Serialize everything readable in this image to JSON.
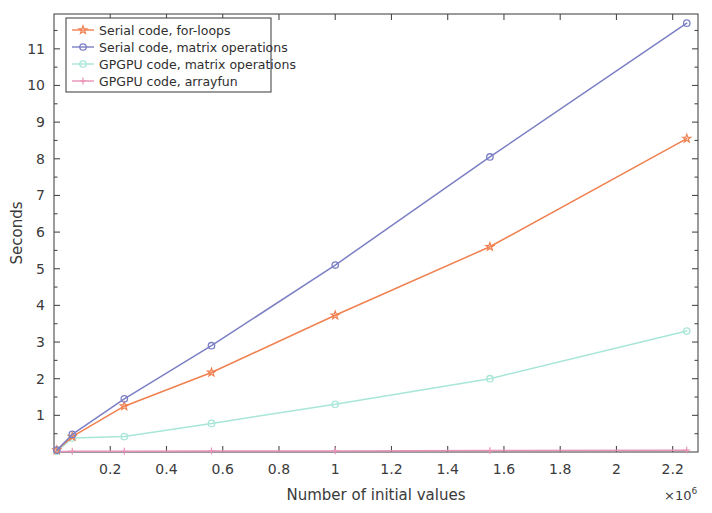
{
  "chart_data": {
    "type": "line",
    "title": "",
    "xlabel": "Number of initial values",
    "ylabel": "Seconds",
    "x_multiplier": "×10",
    "x_multiplier_exponent": "6",
    "xlim": [
      0,
      2.29
    ],
    "ylim": [
      0,
      11.95
    ],
    "xticks": [
      0.2,
      0.4,
      0.6,
      0.8,
      1,
      1.2,
      1.4,
      1.6,
      1.8,
      2,
      2.2
    ],
    "xtick_labels": [
      "0.2",
      "0.4",
      "0.6",
      "0.8",
      "1",
      "1.2",
      "1.4",
      "1.6",
      "1.8",
      "2",
      "2.2"
    ],
    "yticks": [
      1,
      2,
      3,
      4,
      5,
      6,
      7,
      8,
      9,
      10,
      11
    ],
    "ytick_labels": [
      "1",
      "2",
      "3",
      "4",
      "5",
      "6",
      "7",
      "8",
      "9",
      "10",
      "11"
    ],
    "grid": false,
    "legend_position": "upper-left",
    "x": [
      0.01,
      0.065,
      0.25,
      0.56,
      1.0,
      1.55,
      2.25
    ],
    "series": [
      {
        "name": "Serial code, for-loops",
        "color": "#f08050",
        "marker": "star",
        "values": [
          0.05,
          0.42,
          1.25,
          2.17,
          3.73,
          5.6,
          8.55
        ]
      },
      {
        "name": "Serial code, matrix operations",
        "color": "#7b7fc4",
        "marker": "circle",
        "values": [
          0.05,
          0.48,
          1.45,
          2.9,
          5.1,
          8.05,
          11.7
        ]
      },
      {
        "name": "GPGPU code, matrix operations",
        "color": "#a8e6d8",
        "marker": "circle",
        "values": [
          0.02,
          0.38,
          0.42,
          0.78,
          1.3,
          2.0,
          3.3
        ]
      },
      {
        "name": "GPGPU code, arrayfun",
        "color": "#e892b8",
        "marker": "plus",
        "values": [
          0.01,
          0.02,
          0.02,
          0.03,
          0.03,
          0.04,
          0.05
        ]
      }
    ]
  },
  "legend": {
    "items": [
      {
        "label": "Serial code, for-loops"
      },
      {
        "label": "Serial code, matrix operations"
      },
      {
        "label": "GPGPU code, matrix operations"
      },
      {
        "label": "GPGPU code, arrayfun"
      }
    ]
  }
}
